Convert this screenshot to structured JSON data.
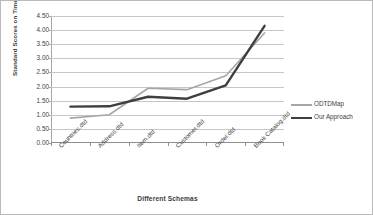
{
  "chart_data": {
    "type": "line",
    "title": "",
    "xlabel": "Different Schemas",
    "ylabel": "Standard Scores on Time",
    "categories": [
      "Countries.dtd",
      "Address.dtd",
      "Item.dtd",
      "Customer.dtd",
      "Order.dtd",
      "Book Catalog.dtd"
    ],
    "series": [
      {
        "name": "ODTDMap",
        "color": "#a6a6a6",
        "width": 1.6,
        "values": [
          0.88,
          1.0,
          1.94,
          1.89,
          2.38,
          3.9
        ]
      },
      {
        "name": "Our Approach",
        "color": "#3f3f3f",
        "width": 2.4,
        "values": [
          1.29,
          1.3,
          1.64,
          1.57,
          2.04,
          4.15
        ]
      }
    ],
    "ylim": [
      0.0,
      4.5
    ],
    "ytick_step": 0.5,
    "ytick_labels": [
      "4.50",
      "4.00",
      "3.50",
      "3.00",
      "2.50",
      "2.00",
      "1.50",
      "1.00",
      "0.50",
      "0.00"
    ],
    "ytick_values": [
      4.5,
      4.0,
      3.5,
      3.0,
      2.5,
      2.0,
      1.5,
      1.0,
      0.5,
      0.0
    ],
    "grid": true,
    "grid_axis": "y",
    "legend_position": "right",
    "gridline_color": "#c6c6c6",
    "axis_color": "#8f8f8f",
    "background": "#ffffff",
    "border_color": "#b9b9b9"
  },
  "legend": {
    "entries": [
      {
        "label": "ODTDMap"
      },
      {
        "label": "Our Approach"
      }
    ]
  }
}
